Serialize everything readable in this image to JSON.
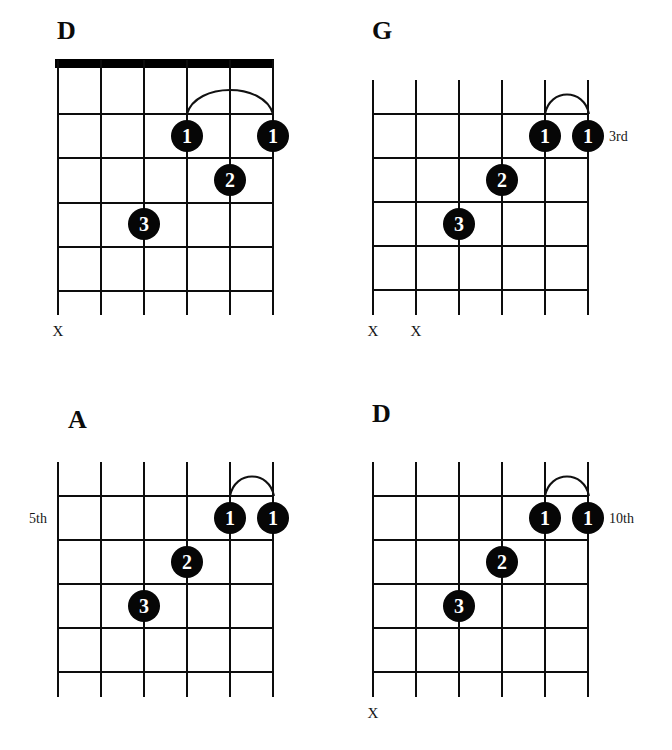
{
  "page": {
    "kind": "guitar-chord-chart",
    "width": 672,
    "height": 750,
    "ink_color": "#0d0d0d",
    "paper_color": "#ffffff"
  },
  "diagrams": [
    {
      "id": "chord-d-open",
      "title": "D",
      "has_nut": true,
      "fret_label": "",
      "fret_label_side": "none",
      "strings": 6,
      "frets": 5,
      "dots": [
        {
          "finger": "1",
          "string": 4,
          "fret": 2
        },
        {
          "finger": "1",
          "string": 6,
          "fret": 2
        },
        {
          "finger": "2",
          "string": 5,
          "fret": 3
        },
        {
          "finger": "3",
          "string": 3,
          "fret": 4
        }
      ],
      "barre": {
        "from_string": 4,
        "to_string": 6,
        "fret": 2
      },
      "mutes": [
        {
          "string": 1,
          "mark": "X"
        }
      ]
    },
    {
      "id": "chord-g-3rd",
      "title": "G",
      "has_nut": false,
      "fret_label": "3rd",
      "fret_label_side": "right",
      "strings": 6,
      "frets": 5,
      "dots": [
        {
          "finger": "1",
          "string": 5,
          "fret": 1
        },
        {
          "finger": "1",
          "string": 6,
          "fret": 1
        },
        {
          "finger": "2",
          "string": 4,
          "fret": 2
        },
        {
          "finger": "3",
          "string": 3,
          "fret": 3
        }
      ],
      "barre": {
        "from_string": 5,
        "to_string": 6,
        "fret": 1
      },
      "mutes": [
        {
          "string": 1,
          "mark": "X"
        },
        {
          "string": 2,
          "mark": "X"
        }
      ]
    },
    {
      "id": "chord-a-5th",
      "title": "A",
      "has_nut": false,
      "fret_label": "5th",
      "fret_label_side": "left",
      "strings": 6,
      "frets": 5,
      "dots": [
        {
          "finger": "1",
          "string": 5,
          "fret": 1
        },
        {
          "finger": "1",
          "string": 6,
          "fret": 1
        },
        {
          "finger": "2",
          "string": 4,
          "fret": 2
        },
        {
          "finger": "3",
          "string": 3,
          "fret": 3
        }
      ],
      "barre": {
        "from_string": 5,
        "to_string": 6,
        "fret": 1
      },
      "mutes": []
    },
    {
      "id": "chord-d-10th",
      "title": "D",
      "has_nut": false,
      "fret_label": "10th",
      "fret_label_side": "right",
      "strings": 6,
      "frets": 5,
      "dots": [
        {
          "finger": "1",
          "string": 5,
          "fret": 1
        },
        {
          "finger": "1",
          "string": 6,
          "fret": 1
        },
        {
          "finger": "2",
          "string": 4,
          "fret": 2
        },
        {
          "finger": "3",
          "string": 3,
          "fret": 3
        }
      ],
      "barre": {
        "from_string": 5,
        "to_string": 6,
        "fret": 1
      },
      "mutes": [
        {
          "string": 1,
          "mark": "X"
        }
      ]
    }
  ],
  "layout": {
    "positions": [
      {
        "left": 57,
        "top": 60,
        "title_left": 57,
        "title_top": 18
      },
      {
        "left": 372,
        "top": 80,
        "title_left": 372,
        "title_top": 18
      },
      {
        "left": 57,
        "top": 462,
        "title_left": 68,
        "title_top": 412
      },
      {
        "left": 372,
        "top": 462,
        "title_left": 372,
        "title_top": 406
      }
    ],
    "string_gap": 43,
    "fret_gap": 44,
    "dot_size": 30
  }
}
